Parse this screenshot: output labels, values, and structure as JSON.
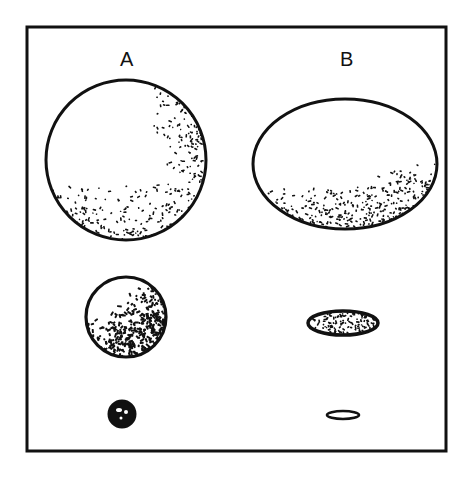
{
  "figure": {
    "frame": {
      "x": 27,
      "y": 27,
      "w": 419,
      "h": 424,
      "stroke": "#111111"
    },
    "columns": [
      {
        "label": "A",
        "label_x": 120,
        "label_y": 48
      },
      {
        "label": "B",
        "label_x": 340,
        "label_y": 48
      }
    ],
    "shapes": [
      {
        "id": "A-large",
        "column": "A",
        "size": "large",
        "shape": "circle",
        "cx": 126,
        "cy": 160,
        "rx": 80,
        "ry": 80,
        "stipple": "sparse-right-bottom"
      },
      {
        "id": "B-large",
        "column": "B",
        "size": "large",
        "shape": "ellipse",
        "cx": 345,
        "cy": 164,
        "rx": 92,
        "ry": 65,
        "stipple": "sparse-bottom"
      },
      {
        "id": "A-medium",
        "column": "A",
        "size": "medium",
        "shape": "circle",
        "cx": 126,
        "cy": 317,
        "rx": 40,
        "ry": 40,
        "stipple": "dense-lower-right"
      },
      {
        "id": "B-medium",
        "column": "B",
        "size": "medium",
        "shape": "ellipse",
        "cx": 343,
        "cy": 323,
        "rx": 35,
        "ry": 12,
        "stipple": "dense"
      },
      {
        "id": "A-small",
        "column": "A",
        "size": "small",
        "shape": "circle",
        "cx": 122,
        "cy": 414,
        "rx": 13,
        "ry": 13,
        "stipple": "solid"
      },
      {
        "id": "B-small",
        "column": "B",
        "size": "small",
        "shape": "ellipse",
        "cx": 343,
        "cy": 415,
        "rx": 16,
        "ry": 4,
        "stipple": "outline-thick"
      }
    ]
  }
}
